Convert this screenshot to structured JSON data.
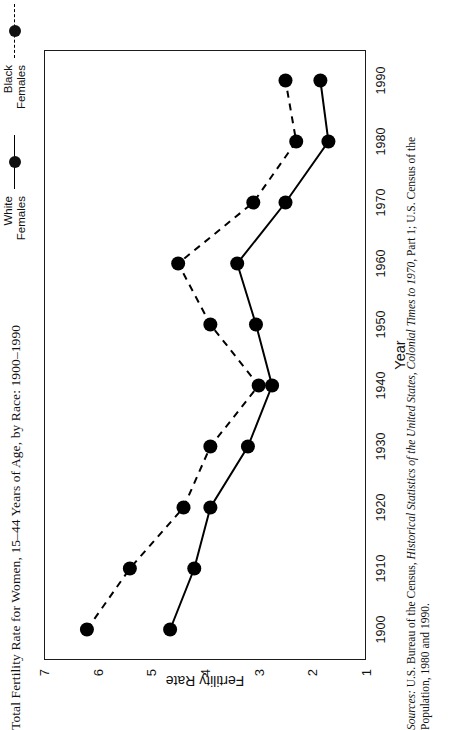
{
  "figure": {
    "title": "Total Fertility Rate for Women, 15–44 Years of Age, by Race: 1900–1990",
    "source_prefix": "Sources:",
    "source_text_1": " U.S. Bureau of the Census, ",
    "source_italic_1": "Historical Statistics of the United States, Colonial Times to 1970",
    "source_text_2": ", Part 1; U.S. Census of the Population, 1980 and 1990."
  },
  "legend": {
    "items": [
      {
        "label_line1": "White",
        "label_line2": "Females",
        "style": "solid",
        "marker": "filled-circle"
      },
      {
        "label_line1": "Black",
        "label_line2": "Females",
        "style": "dashed",
        "marker": "filled-circle"
      }
    ]
  },
  "chart_data": {
    "type": "line",
    "title": "Total Fertility Rate for Women, 15–44 Years of Age, by Race: 1900–1990",
    "xlabel": "Year",
    "ylabel": "Fertility Rate",
    "x": [
      1900,
      1910,
      1920,
      1930,
      1940,
      1950,
      1960,
      1970,
      1980,
      1990
    ],
    "xticklabels": [
      "1900",
      "1910",
      "1920",
      "1930",
      "1940",
      "1950",
      "1960",
      "1970",
      "1980",
      "1990"
    ],
    "xlim": [
      1895,
      1995
    ],
    "ylim": [
      1,
      7
    ],
    "yticks": [
      1,
      2,
      3,
      4,
      5,
      6,
      7
    ],
    "yticklabels": [
      "1",
      "2",
      "3",
      "4",
      "5",
      "6",
      "7"
    ],
    "grid": false,
    "legend_position": "top-right",
    "series": [
      {
        "name": "White Females",
        "style": "solid",
        "color": "#000000",
        "values": [
          4.65,
          4.2,
          3.9,
          3.2,
          2.75,
          3.05,
          3.4,
          2.5,
          1.7,
          1.85
        ]
      },
      {
        "name": "Black Females",
        "style": "dashed",
        "color": "#000000",
        "values": [
          6.2,
          5.4,
          4.4,
          3.9,
          3.0,
          3.9,
          4.5,
          3.1,
          2.3,
          2.5
        ]
      }
    ]
  }
}
